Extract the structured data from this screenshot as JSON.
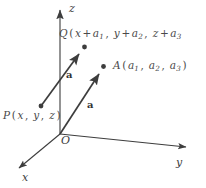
{
  "figure": {
    "background_color": "#ffffff",
    "line_color": "#3d3d3d",
    "text_color": "#4a4a4a",
    "width": 206,
    "height": 188
  },
  "axes": {
    "x": {
      "label": "x",
      "origin": [
        60,
        134
      ],
      "tip": [
        14,
        172
      ]
    },
    "y": {
      "label": "y",
      "origin": [
        60,
        134
      ],
      "tip": [
        191,
        148
      ]
    },
    "z": {
      "label": "z",
      "origin": [
        60,
        134
      ],
      "tip": [
        60,
        6
      ]
    }
  },
  "origin": {
    "label": "O",
    "position": [
      60,
      134
    ]
  },
  "points": {
    "P": {
      "label_parts": {
        "name": "P",
        "open": "(",
        "c1": "x",
        "c2": "y",
        "c3": "z",
        "close": ")"
      },
      "label_text": "P(x, y, z)",
      "position": [
        41,
        106
      ]
    },
    "Q": {
      "label_parts": {
        "name": "Q",
        "open": "(",
        "t1_base": "x",
        "t1_op": "+",
        "t1_term": "a",
        "t1_sub": "1",
        "t2_base": "y",
        "t2_op": "+",
        "t2_term": "a",
        "t2_sub": "2",
        "t3_base": "z",
        "t3_op": "+",
        "t3_term": "a",
        "t3_sub": "3"
      },
      "label_text": "Q(x + a1, y + a2, z + a3",
      "position": [
        84,
        47
      ]
    },
    "A": {
      "label_parts": {
        "name": "A",
        "open": "(",
        "c1": "a",
        "s1": "1",
        "c2": "a",
        "s2": "2",
        "c3": "a",
        "s3": "3",
        "close": ")"
      },
      "label_text": "A(a1, a2, a3)",
      "position": [
        103,
        67
      ]
    }
  },
  "vectors": [
    {
      "name": "vector-PQ",
      "label": "a",
      "from": [
        41,
        106
      ],
      "to": [
        84,
        47
      ],
      "label_position": [
        66,
        70
      ]
    },
    {
      "name": "vector-OA",
      "label": "a",
      "from": [
        60,
        134
      ],
      "to": [
        103,
        67
      ],
      "label_position": [
        87,
        100
      ]
    }
  ]
}
